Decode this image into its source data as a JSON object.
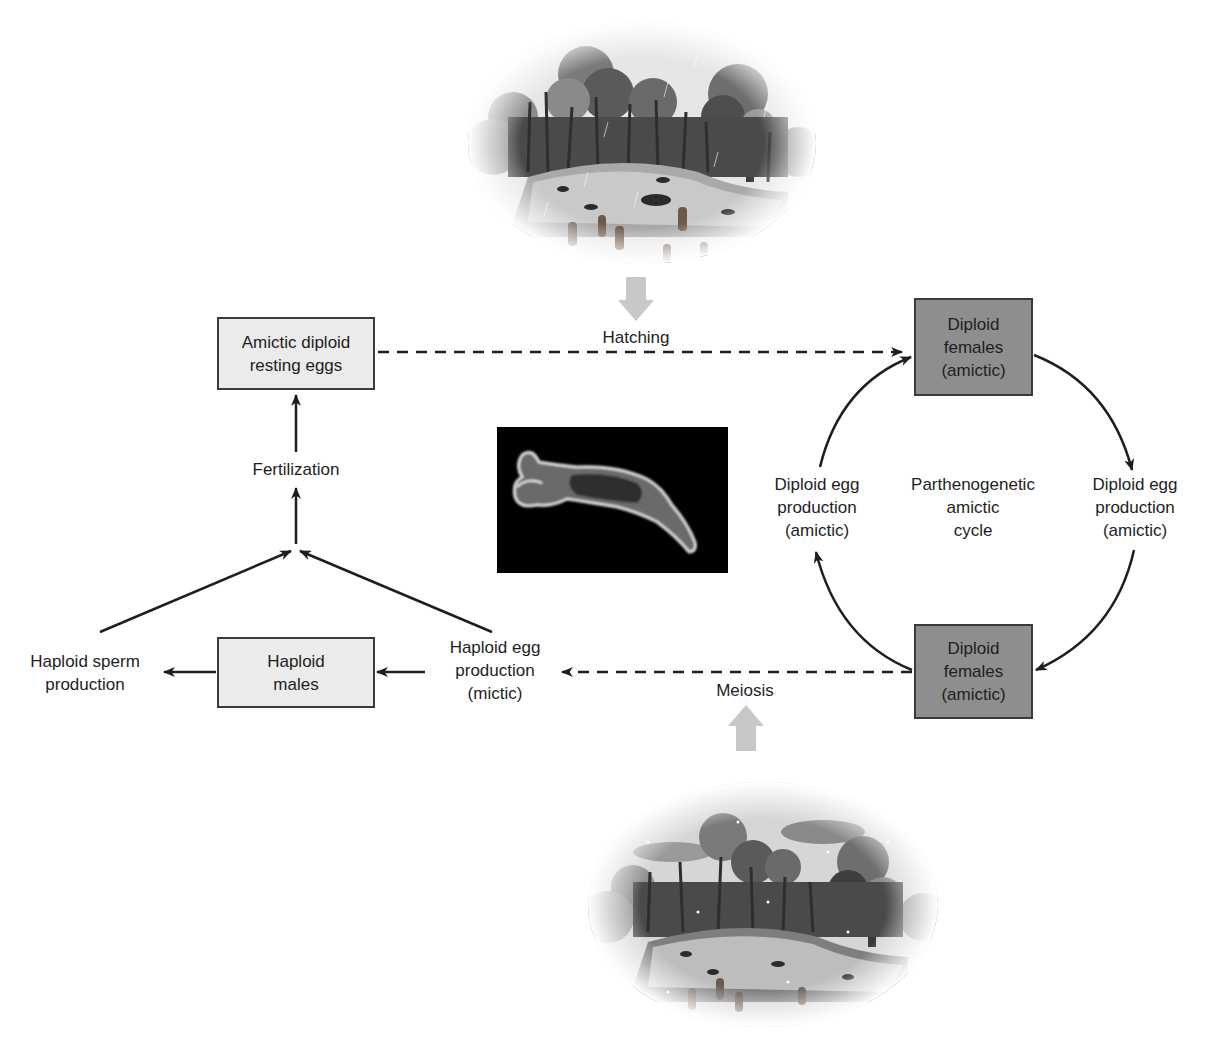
{
  "nodes": {
    "amictic_eggs": "Amictic diploid\nresting eggs",
    "diploid_females_top": "Diploid\nfemales\n(amictic)",
    "diploid_females_bottom": "Diploid\nfemales\n(amictic)",
    "haploid_males": "Haploid\nmales"
  },
  "labels": {
    "hatching": "Hatching",
    "meiosis": "Meiosis",
    "fertilization": "Fertilization",
    "haploid_sperm": "Haploid sperm\nproduction",
    "haploid_egg": "Haploid egg\nproduction\n(mictic)",
    "diploid_egg_left": "Diploid egg\nproduction\n(amictic)",
    "diploid_egg_right": "Diploid egg\nproduction\n(amictic)",
    "cycle_center": "Parthenogenetic\namictic\ncycle"
  },
  "images": {
    "top": "rainy-pond-illustration",
    "center": "rotifer-micrograph",
    "bottom": "snowy-pond-illustration"
  },
  "colors": {
    "light_box": "#ebebeb",
    "dark_box": "#8e8e8e",
    "stage_arrow": "#c8c8c8",
    "line": "#1e1e1e"
  }
}
